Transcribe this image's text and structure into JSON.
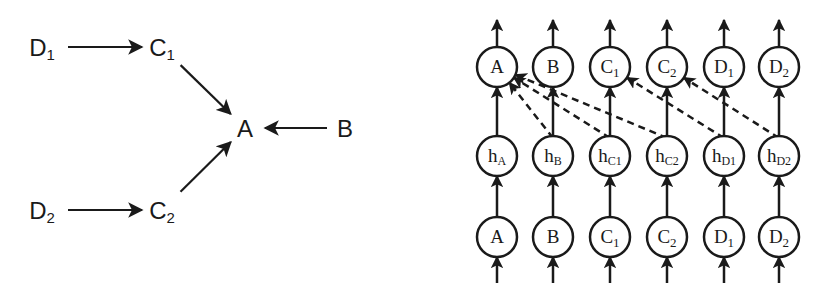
{
  "left_graph": {
    "nodes": [
      {
        "id": "D1",
        "label": "D",
        "sub": "1",
        "x": 42,
        "y": 47
      },
      {
        "id": "C1",
        "label": "C",
        "sub": "1",
        "x": 162,
        "y": 47
      },
      {
        "id": "A",
        "label": "A",
        "sub": "",
        "x": 245,
        "y": 128
      },
      {
        "id": "B",
        "label": "B",
        "sub": "",
        "x": 345,
        "y": 128
      },
      {
        "id": "D2",
        "label": "D",
        "sub": "2",
        "x": 42,
        "y": 210
      },
      {
        "id": "C2",
        "label": "C",
        "sub": "2",
        "x": 162,
        "y": 210
      }
    ],
    "edges": [
      {
        "from": "D1",
        "to": "C1"
      },
      {
        "from": "C1",
        "to": "A"
      },
      {
        "from": "B",
        "to": "A"
      },
      {
        "from": "D2",
        "to": "C2"
      },
      {
        "from": "C2",
        "to": "A"
      }
    ]
  },
  "right_graph": {
    "columns_x": [
      497,
      553,
      610,
      667,
      724,
      779
    ],
    "rows_y": {
      "output": 67,
      "hidden": 156,
      "input": 237
    },
    "node_radius": 20,
    "output_nodes": [
      {
        "label": "A",
        "sub": ""
      },
      {
        "label": "B",
        "sub": ""
      },
      {
        "label": "C",
        "sub": "1"
      },
      {
        "label": "C",
        "sub": "2"
      },
      {
        "label": "D",
        "sub": "1"
      },
      {
        "label": "D",
        "sub": "2"
      }
    ],
    "hidden_nodes": [
      {
        "label": "h",
        "sub": "A"
      },
      {
        "label": "h",
        "sub": "B"
      },
      {
        "label": "h",
        "sub": "C1"
      },
      {
        "label": "h",
        "sub": "C2"
      },
      {
        "label": "h",
        "sub": "D1"
      },
      {
        "label": "h",
        "sub": "D2"
      }
    ],
    "input_nodes": [
      {
        "label": "A",
        "sub": ""
      },
      {
        "label": "B",
        "sub": ""
      },
      {
        "label": "C",
        "sub": "1"
      },
      {
        "label": "C",
        "sub": "2"
      },
      {
        "label": "D",
        "sub": "1"
      },
      {
        "label": "D",
        "sub": "2"
      }
    ],
    "dashed_edges": [
      {
        "from_hidden": 1,
        "to_output": 0
      },
      {
        "from_hidden": 2,
        "to_output": 0
      },
      {
        "from_hidden": 3,
        "to_output": 0
      },
      {
        "from_hidden": 4,
        "to_output": 2
      },
      {
        "from_hidden": 5,
        "to_output": 3
      }
    ]
  },
  "colors": {
    "stroke": "#1a1a1a",
    "background": "#ffffff"
  }
}
